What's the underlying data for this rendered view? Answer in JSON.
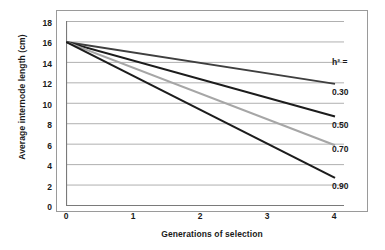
{
  "chart_data": {
    "type": "line",
    "title": "",
    "xlabel": "Generations of selection",
    "ylabel": "Average internode length (cm)",
    "xlim": [
      0,
      4
    ],
    "ylim": [
      0,
      18
    ],
    "xticks": [
      "0",
      "1",
      "2",
      "3",
      "4"
    ],
    "yticks": [
      "0",
      "2",
      "4",
      "6",
      "8",
      "10",
      "12",
      "14",
      "16",
      "18"
    ],
    "grid": "horizontal",
    "legend_position": "right-of-plot-at-line-ends",
    "legend_title": "h² =",
    "x": [
      0,
      4
    ],
    "series": [
      {
        "name": "0.30",
        "label": "0.30",
        "values": [
          16.0,
          11.9
        ],
        "color": "#3f3f3f"
      },
      {
        "name": "0.50",
        "label": "0.50",
        "values": [
          16.0,
          8.7
        ],
        "color": "#1c1c1c"
      },
      {
        "name": "0.70",
        "label": "0.70",
        "values": [
          16.0,
          5.9
        ],
        "color": "#a6a6a6"
      },
      {
        "name": "0.90",
        "label": "0.90",
        "values": [
          16.0,
          2.7
        ],
        "color": "#1c1c1c"
      }
    ]
  },
  "axis": {
    "y_title": "Average internode length (cm)",
    "x_title": "Generations of selection"
  },
  "colors": {
    "frame": "#9a9a9a",
    "gridline": "#b0b0b0",
    "axis": "#7a7a7a",
    "text": "#1a1a1a",
    "background": "#ffffff"
  }
}
